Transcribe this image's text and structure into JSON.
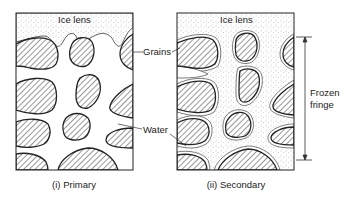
{
  "figure": {
    "panels": [
      {
        "id": "primary",
        "ice_label": "Ice lens",
        "caption": "(i) Primary"
      },
      {
        "id": "secondary",
        "ice_label": "Ice lens",
        "caption": "(ii) Secondary"
      }
    ],
    "labels": {
      "grains": "Grains",
      "water": "Water",
      "frozen_fringe_line1": "Frozen",
      "frozen_fringe_line2": "fringe"
    },
    "colors": {
      "outline": "#222222",
      "hatch": "#333333",
      "stipple": "#9a9a9a",
      "background": "#ffffff"
    }
  }
}
